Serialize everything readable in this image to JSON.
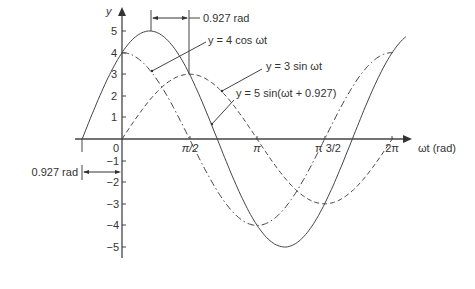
{
  "chart_data": {
    "type": "line",
    "title": "",
    "xlabel": "ωt (rad)",
    "ylabel": "y",
    "x_ticks": [
      "0",
      "π/2",
      "π",
      "π 3/2",
      "2π"
    ],
    "x_tick_values": [
      0,
      1.5708,
      3.1416,
      4.7124,
      6.2832
    ],
    "y_ticks": [
      5,
      4,
      3,
      2,
      1,
      0,
      -1,
      -2,
      -3,
      -4,
      -5
    ],
    "xlim": [
      -0.927,
      6.6
    ],
    "ylim": [
      -5.5,
      5.5
    ],
    "grid": false,
    "series": [
      {
        "name": "y = 4 cos ωt",
        "style": "dash-dot",
        "formula": "4*cos(x)",
        "x_range": [
          0,
          6.3
        ]
      },
      {
        "name": "y = 3 sin ωt",
        "style": "dashed",
        "formula": "3*sin(x)",
        "x_range": [
          0,
          6.3
        ]
      },
      {
        "name": "y = 5 sin(ωt + 0.927)",
        "style": "solid",
        "formula": "5*sin(x+0.927)",
        "x_range": [
          -0.927,
          6.6
        ]
      }
    ],
    "annotations": [
      {
        "text": "0.927 rad",
        "position": "top, between peak of resultant and π/2"
      },
      {
        "text": "0.927 rad",
        "position": "left, between -0.927 and 0 at y≈-1.5"
      }
    ]
  },
  "labels": {
    "y_axis": "y",
    "x_axis": "ωt (rad)",
    "legend_cos": "y = 4 cos ωt",
    "legend_sin": "y = 3 sin ωt",
    "legend_res": "y = 5 sin(ωt + 0.927)",
    "phase_top": "0.927 rad",
    "phase_left": "0.927 rad",
    "x0": "0",
    "x1": "π/2",
    "x2": "π",
    "x3": "π 3/2",
    "x4": "2π",
    "y5": "5",
    "y4": "4",
    "y3": "3",
    "y2": "2",
    "y1": "1",
    "yn1": "−1",
    "yn2": "−2",
    "yn3": "−3",
    "yn4": "−4",
    "yn5": "−5"
  },
  "colors": {
    "line": "#444444",
    "text": "#333333"
  }
}
